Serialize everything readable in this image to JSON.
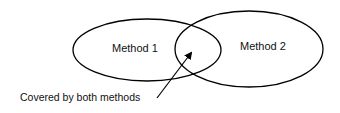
{
  "diagram": {
    "type": "venn",
    "sets": [
      {
        "label": "Method 1"
      },
      {
        "label": "Method 2"
      }
    ],
    "annotation": {
      "label": "Covered by both methods",
      "points_to": "intersection"
    }
  },
  "colors": {
    "stroke": "#000000",
    "background": "#ffffff",
    "text": "#111111"
  }
}
